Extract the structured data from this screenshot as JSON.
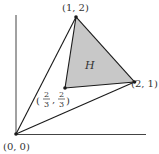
{
  "diagram": {
    "type": "coordinate-geometry",
    "colors": {
      "stroke": "#1a1a1a",
      "fill_region": "#c8c8c8",
      "background": "#ffffff"
    },
    "points": [
      {
        "id": "origin",
        "label": "(0, 0)",
        "x": 0,
        "y": 0
      },
      {
        "id": "A",
        "label": "(1, 2)",
        "x": 1,
        "y": 2
      },
      {
        "id": "B",
        "label": "(2, 1)",
        "x": 2,
        "y": 1
      },
      {
        "id": "G",
        "label_num_x": "2",
        "label_den_x": "3",
        "label_num_y": "2",
        "label_den_y": "3",
        "x": 0.6667,
        "y": 0.6667
      }
    ],
    "region_label": "H",
    "segments": [
      [
        "origin",
        "A"
      ],
      [
        "origin",
        "B"
      ],
      [
        "A",
        "B"
      ],
      [
        "A",
        "G"
      ],
      [
        "G",
        "B"
      ]
    ],
    "shaded_region": [
      "A",
      "G",
      "B"
    ]
  }
}
